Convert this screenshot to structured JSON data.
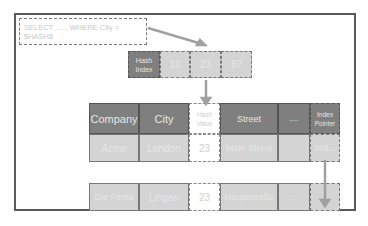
{
  "query": {
    "text": "SELECT ...... WHERE City = $HASH$"
  },
  "hash_index": {
    "label": "Hash Index",
    "buckets": [
      "10",
      "23",
      "87"
    ]
  },
  "table": {
    "headers": [
      "Company",
      "City",
      "Hash Value",
      "Street",
      "....",
      "Index Pointer"
    ],
    "rows": [
      [
        "Acme",
        "London",
        "23",
        "Main Street",
        "....",
        "0x8..."
      ],
      [
        "Die Firma",
        "Lingen",
        "23",
        "Hauptstraße",
        "....",
        ""
      ]
    ]
  },
  "colors": {
    "dark_cell": "#7f7f7f",
    "light_cell": "#d4d4d4",
    "arrow": "#a0a0a0"
  }
}
